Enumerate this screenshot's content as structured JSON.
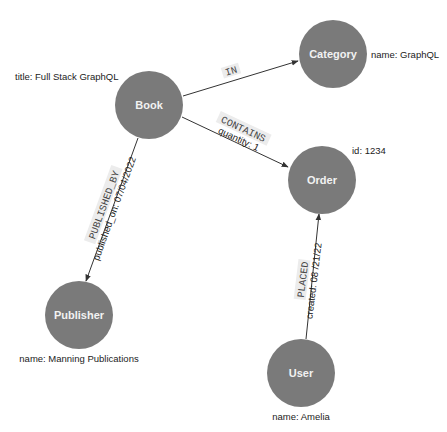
{
  "colors": {
    "node_fill": "#7a7a7a",
    "node_text": "#f2f2f2",
    "edge": "#333333",
    "rel_label_bg": "#ececec"
  },
  "nodes": {
    "book": {
      "label": "Book",
      "property": "title: Full Stack GraphQL"
    },
    "category": {
      "label": "Category",
      "property": "name: GraphQL"
    },
    "order": {
      "label": "Order",
      "property": "id: 1234"
    },
    "publisher": {
      "label": "Publisher",
      "property": "name: Manning Publications"
    },
    "user": {
      "label": "User",
      "property": "name: Amelia"
    }
  },
  "relationships": {
    "in": {
      "type": "IN",
      "from": "Book",
      "to": "Category"
    },
    "contains": {
      "type": "CONTAINS",
      "property": "quantity: 1",
      "from": "Book",
      "to": "Order"
    },
    "published_by": {
      "type": "PUBLISHED_BY",
      "property": "published_on: 07/04/2022",
      "from": "Book",
      "to": "Publisher"
    },
    "placed": {
      "type": "PLACED",
      "property": "created: 08 /21/22",
      "from": "User",
      "to": "Order"
    }
  }
}
